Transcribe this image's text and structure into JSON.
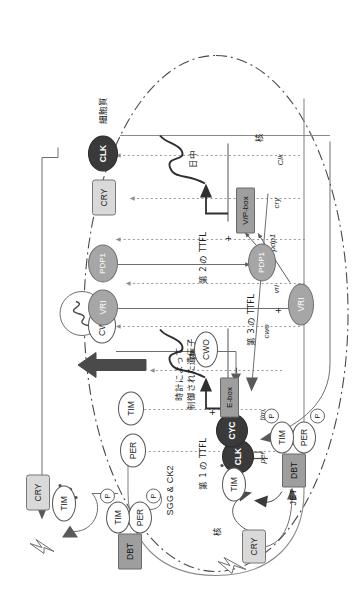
{
  "figure": {
    "type": "diagram",
    "language": "ja"
  },
  "compartments": {
    "cytoplasm_label": "細胞質",
    "nucleus_label_left": "核",
    "nucleus_label_right": "核"
  },
  "loops": {
    "first": "第 1 の TTFL",
    "second": "第 2 の TTFL",
    "third": "第 3 の TTFL"
  },
  "output": {
    "clock_controlled_genes": "時計によって\n制御された遺伝子",
    "ccg_line1": "時計によって",
    "ccg_line2": "制御された遺伝子",
    "rhythm_icon": "∿"
  },
  "phase_labels": {
    "night": "夜",
    "day": "日中"
  },
  "kinases": {
    "label": "SGG & CK2"
  },
  "proteins": {
    "cytoplasm": [
      {
        "name": "TIM",
        "shape": "ellipse",
        "fill": "#ffffff"
      },
      {
        "name": "PER",
        "shape": "ellipse",
        "fill": "#ffffff"
      },
      {
        "name": "TIM",
        "shape": "ellipse",
        "fill": "#ffffff"
      },
      {
        "name": "CWO",
        "shape": "ellipse",
        "fill": "#ffffff"
      },
      {
        "name": "VRI",
        "shape": "ellipse",
        "fill": "#a6a6a6"
      },
      {
        "name": "PDP1",
        "shape": "ellipse",
        "fill": "#a6a6a6"
      },
      {
        "name": "CRY",
        "shape": "rounded",
        "fill": "#d9d9d9"
      },
      {
        "name": "CLK",
        "shape": "ellipse",
        "fill": "#3a3a3a"
      }
    ],
    "complex": {
      "dbt": "DBT",
      "per": "PER",
      "tim": "TIM",
      "phosphate": "P"
    },
    "nucleus": [
      {
        "name": "CRY",
        "shape": "rounded",
        "fill": "#d9d9d9"
      },
      {
        "name": "TIM",
        "shape": "ellipse",
        "fill": "#ffffff"
      },
      {
        "name": "DBT",
        "shape": "rect",
        "fill": "#9e9e9e"
      },
      {
        "name": "PER",
        "shape": "ellipse",
        "fill": "#ffffff"
      },
      {
        "name": "TIM",
        "shape": "ellipse",
        "fill": "#ffffff"
      },
      {
        "name": "CLK",
        "shape": "ellipse",
        "fill": "#3a3a3a"
      },
      {
        "name": "CYC",
        "shape": "ellipse",
        "fill": "#3a3a3a"
      },
      {
        "name": "CWO",
        "shape": "ellipse",
        "fill": "#ffffff"
      },
      {
        "name": "PDP1",
        "shape": "ellipse",
        "fill": "#a6a6a6"
      },
      {
        "name": "VRI",
        "shape": "ellipse",
        "fill": "#a6a6a6"
      }
    ],
    "jet": "JET"
  },
  "promoters": {
    "e_box": "E-box",
    "vp_box": "V/P-box"
  },
  "genes": [
    {
      "name": "per"
    },
    {
      "name": "tim"
    },
    {
      "name": "cwo"
    },
    {
      "name": "vri"
    },
    {
      "name": "pdp1"
    },
    {
      "name": "cry"
    },
    {
      "name": "Clk"
    }
  ],
  "signs": {
    "plus": "+",
    "minus": "−",
    "minus2": "−",
    "plus2": "+",
    "plus3": "+",
    "minus3": "|"
  },
  "colors": {
    "dark_protein": "#3a3a3a",
    "gray_protein": "#a6a6a6",
    "light_box": "#d9d9d9",
    "mid_box": "#9e9e9e",
    "line": "#6e6e6e",
    "dotted": "#9a9a9a",
    "text": "#1d1d1d",
    "arrow_big": "#4a4a4a"
  }
}
